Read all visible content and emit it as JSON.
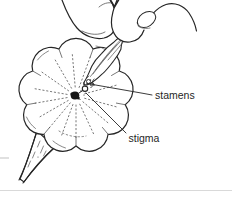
{
  "figure": {
    "labels": {
      "stamens": "stamens",
      "stigma": "stigma"
    }
  },
  "icons": {
    "hand": "pinching-fingers-illustration",
    "flower": "scalloped-flower-illustration",
    "stamens_bundle": "plucked-stamens-bundle",
    "stigma_dot": "flower-center-stigma"
  },
  "colors": {
    "ink": "#262626",
    "soft_ink": "#555555",
    "background": "#ffffff",
    "faint_rule": "#d9d9d9",
    "text": "#1f1f1f"
  }
}
